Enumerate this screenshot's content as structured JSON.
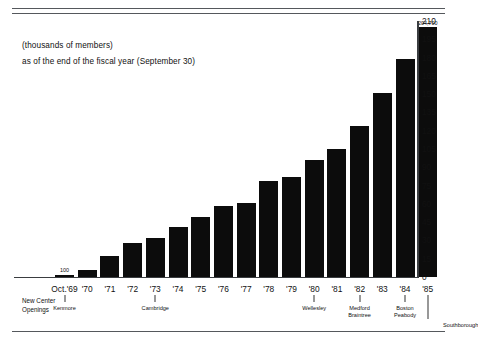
{
  "caption": {
    "line1": "(thousands of members)",
    "line2": "as of the end of the fiscal year (September 30)"
  },
  "axis_note": "New Center\nOpenings",
  "axis_note_line1": "New Center",
  "axis_note_line2": "Openings",
  "chart_data": {
    "type": "bar",
    "title": "",
    "subtitle": "(thousands of members) as of the end of the fiscal year (September 30)",
    "xlabel": "",
    "ylabel": "(thousands of members)",
    "ylim": [
      0,
      210
    ],
    "yticks": [
      0,
      15,
      30,
      45,
      60,
      75,
      90,
      105,
      120,
      135,
      150,
      165,
      180,
      195,
      210
    ],
    "grid": false,
    "legend": "none",
    "bar_color": "#0c0c0c",
    "categories": [
      "Oct.'69",
      "'70",
      "'71",
      "'72",
      "'73",
      "'74",
      "'75",
      "'76",
      "'77",
      "'78",
      "'79",
      "'80",
      "'81",
      "'82",
      "'83",
      "'84",
      "'85"
    ],
    "values": [
      2,
      6,
      17,
      28,
      32,
      41,
      49,
      58,
      61,
      79,
      82,
      96,
      105,
      124,
      151,
      179,
      204.7
    ],
    "data_labels": [
      {
        "category": "Oct.'69",
        "text": "100"
      },
      {
        "category": "'85",
        "text": "204,700"
      }
    ],
    "annotations": [
      {
        "category": "Oct.'69",
        "text": "Kenmore"
      },
      {
        "category": "'73",
        "text": "Cambridge"
      },
      {
        "category": "'80",
        "text": "Wellesley"
      },
      {
        "category": "'82",
        "text": "Medford\nBraintree"
      },
      {
        "category": "'84",
        "text": "Boston\nPeabody"
      },
      {
        "category": "'85",
        "text": "Southborough"
      }
    ],
    "annotation_group_label": "New Center Openings"
  },
  "yticks_display": [
    "210",
    "195",
    "180",
    "165",
    "150",
    "135",
    "120",
    "105",
    "90",
    "75",
    "60",
    "45",
    "30",
    "15",
    "0"
  ],
  "annotations_display": {
    "kenmore": "Kenmore",
    "cambridge": "Cambridge",
    "wellesley": "Wellesley",
    "medford": "Medford",
    "braintree": "Braintree",
    "boston": "Boston",
    "peabody": "Peabody",
    "southborough": "Southborough"
  },
  "labels_display": {
    "first_bar_value": "100",
    "last_bar_value": "204,700"
  }
}
